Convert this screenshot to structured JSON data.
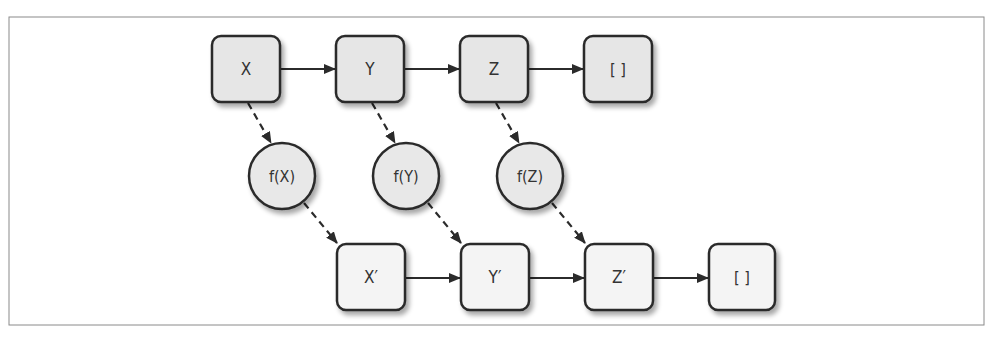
{
  "diagram": {
    "title": "",
    "type": "map-transformation",
    "colors": {
      "border": "#2b2b2b",
      "frame": "#8a8a8a",
      "top_box_fill": "#e6e6e6",
      "bottom_box_fill": "#f4f4f4",
      "circle_fill": "#e8e8e8",
      "text": "#333333"
    },
    "input_list": [
      {
        "id": "x",
        "label": "X"
      },
      {
        "id": "y",
        "label": "Y"
      },
      {
        "id": "z",
        "label": "Z"
      },
      {
        "id": "empty",
        "label": "[ ]"
      }
    ],
    "functions": [
      {
        "id": "fx",
        "label": "f(X)"
      },
      {
        "id": "fy",
        "label": "f(Y)"
      },
      {
        "id": "fz",
        "label": "f(Z)"
      }
    ],
    "output_list": [
      {
        "id": "xp",
        "label": "X′"
      },
      {
        "id": "yp",
        "label": "Y′"
      },
      {
        "id": "zp",
        "label": "Z′"
      },
      {
        "id": "empty2",
        "label": "[ ]"
      }
    ],
    "edges": [
      {
        "from": "X",
        "to": "Y",
        "style": "solid"
      },
      {
        "from": "Y",
        "to": "Z",
        "style": "solid"
      },
      {
        "from": "Z",
        "to": "[ ]",
        "style": "solid"
      },
      {
        "from": "X",
        "to": "f(X)",
        "style": "dashed"
      },
      {
        "from": "Y",
        "to": "f(Y)",
        "style": "dashed"
      },
      {
        "from": "Z",
        "to": "f(Z)",
        "style": "dashed"
      },
      {
        "from": "f(X)",
        "to": "X′",
        "style": "dashed"
      },
      {
        "from": "f(Y)",
        "to": "Y′",
        "style": "dashed"
      },
      {
        "from": "f(Z)",
        "to": "Z′",
        "style": "dashed"
      },
      {
        "from": "X′",
        "to": "Y′",
        "style": "solid"
      },
      {
        "from": "Y′",
        "to": "Z′",
        "style": "solid"
      },
      {
        "from": "Z′",
        "to": "[ ]",
        "style": "solid"
      }
    ]
  }
}
